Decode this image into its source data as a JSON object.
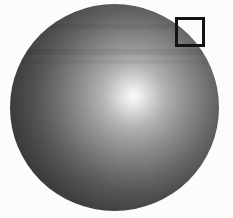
{
  "figure": {
    "canvas": {
      "width": 233,
      "height": 218,
      "background_color": "#ffffff"
    },
    "sphere": {
      "left": 10,
      "top": 4,
      "width": 209,
      "height": 207,
      "highlight_x_pct": 59,
      "highlight_y_pct": 44.5,
      "gradient_radius_px": 126,
      "edge_blur_px": 0.7,
      "gradient_stops": [
        {
          "pos": 0,
          "color": "#fdfdfd"
        },
        {
          "pos": 4,
          "color": "#f4f4f4"
        },
        {
          "pos": 12,
          "color": "#dcdcdc"
        },
        {
          "pos": 25,
          "color": "#b4b4b4"
        },
        {
          "pos": 40,
          "color": "#959595"
        },
        {
          "pos": 55,
          "color": "#7a7a7a"
        },
        {
          "pos": 66,
          "color": "#666666"
        },
        {
          "pos": 80,
          "color": "#515151"
        },
        {
          "pos": 92,
          "color": "#434343"
        },
        {
          "pos": 100,
          "color": "#3b3b3b"
        }
      ]
    },
    "scan_bands": [
      {
        "top": 20,
        "height": 5,
        "color": "rgba(0,0,0,0.05)"
      },
      {
        "top": 45,
        "height": 6,
        "color": "rgba(0,0,0,0.06)"
      },
      {
        "top": 56,
        "height": 4,
        "color": "rgba(0,0,0,0.04)"
      }
    ],
    "roi_box": {
      "left": 175,
      "top": 17,
      "size": 30,
      "border_width": 3,
      "border_color": "#131313"
    },
    "grain": {
      "opacity": 0.28,
      "base_frequency": 0.9
    }
  }
}
